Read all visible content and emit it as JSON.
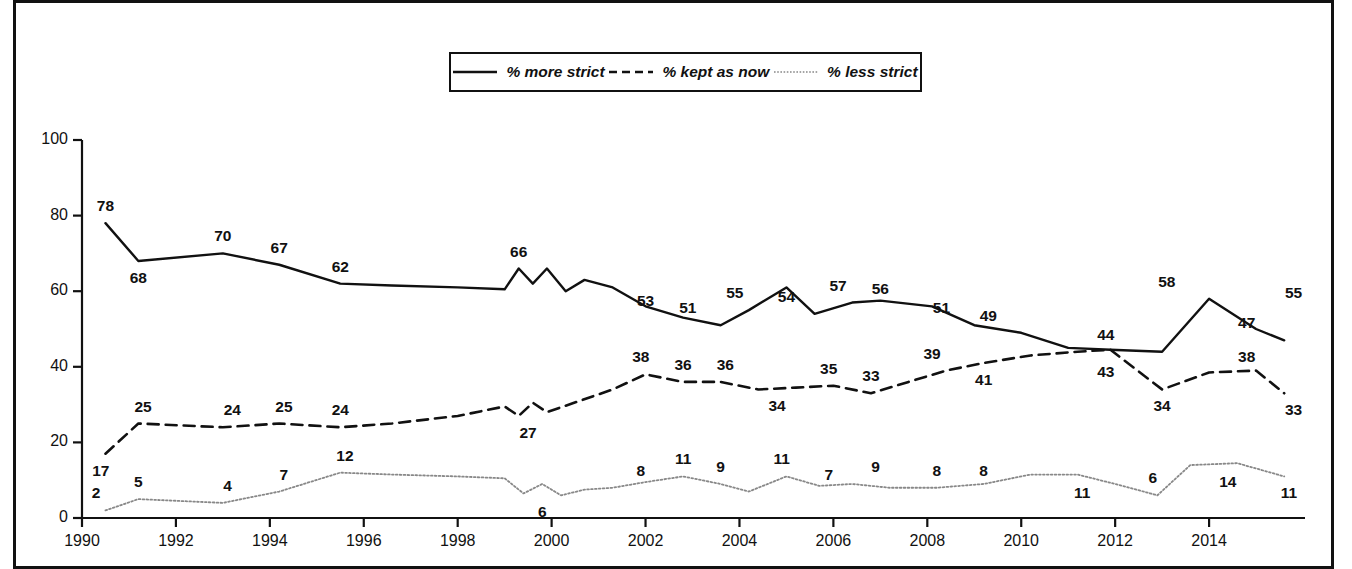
{
  "legend": {
    "items": [
      {
        "label": "% more strict",
        "style": "solid",
        "icon": "solid-line-icon"
      },
      {
        "label": "% kept as now",
        "style": "dashed",
        "icon": "dashed-line-icon"
      },
      {
        "label": "% less strict",
        "style": "dotted",
        "icon": "dotted-line-icon"
      }
    ]
  },
  "chart_data": {
    "type": "line",
    "title": "",
    "subtitle": "",
    "xlabel": "",
    "ylabel": "",
    "xlim": [
      1990,
      2016
    ],
    "ylim": [
      0,
      100
    ],
    "yticks": [
      0,
      20,
      40,
      60,
      80,
      100
    ],
    "xticks": [
      1990,
      1992,
      1994,
      1996,
      1998,
      2000,
      2002,
      2004,
      2006,
      2008,
      2010,
      2012,
      2014
    ],
    "grid": false,
    "legend_position": "top-center",
    "series": [
      {
        "name": "% more strict",
        "style": "solid",
        "color": "#111111",
        "x": [
          1990.5,
          1991.2,
          1993.0,
          1994.2,
          1995.5,
          1996.6,
          1998.0,
          1999.0,
          1999.3,
          1999.6,
          1999.9,
          2000.3,
          2000.7,
          2001.3,
          2002.0,
          2002.8,
          2003.6,
          2004.2,
          2005.0,
          2005.6,
          2006.4,
          2007.0,
          2008.1,
          2009.0,
          2010.0,
          2011.0,
          2011.9,
          2013.0,
          2014.0,
          2015.0,
          2015.6
        ],
        "y": [
          78,
          68,
          70,
          67,
          62,
          61.5,
          61,
          60.5,
          66,
          62,
          66,
          60,
          63,
          61,
          56,
          53,
          51,
          55,
          61,
          54,
          57,
          57.5,
          56,
          51,
          49,
          45,
          44.5,
          44,
          58,
          50,
          47
        ],
        "labels": [
          {
            "x": 1990.5,
            "y": 78,
            "text": "78"
          },
          {
            "x": 1991.2,
            "y": 68,
            "text": "68"
          },
          {
            "x": 1993.0,
            "y": 70,
            "text": "70"
          },
          {
            "x": 1994.2,
            "y": 67,
            "text": "67"
          },
          {
            "x": 1995.5,
            "y": 62,
            "text": "62"
          },
          {
            "x": 1999.3,
            "y": 66,
            "text": "66"
          },
          {
            "x": 2002.0,
            "y": 53,
            "text": "53"
          },
          {
            "x": 2002.9,
            "y": 51,
            "text": "51"
          },
          {
            "x": 2003.9,
            "y": 55,
            "text": "55"
          },
          {
            "x": 2005.0,
            "y": 54,
            "text": "54"
          },
          {
            "x": 2006.1,
            "y": 57,
            "text": "57"
          },
          {
            "x": 2007.0,
            "y": 56,
            "text": "56"
          },
          {
            "x": 2008.3,
            "y": 51,
            "text": "51"
          },
          {
            "x": 2009.3,
            "y": 49,
            "text": "49"
          },
          {
            "x": 2011.8,
            "y": 44,
            "text": "44"
          },
          {
            "x": 2013.1,
            "y": 58,
            "text": "58"
          },
          {
            "x": 2014.8,
            "y": 47,
            "text": "47"
          },
          {
            "x": 2015.8,
            "y": 55,
            "text": "55"
          }
        ]
      },
      {
        "name": "% kept as now",
        "style": "dashed",
        "color": "#111111",
        "x": [
          1990.5,
          1991.2,
          1993.0,
          1994.2,
          1995.5,
          1996.6,
          1998.0,
          1999.0,
          1999.3,
          1999.6,
          1999.9,
          2000.6,
          2001.3,
          2002.0,
          2002.8,
          2003.6,
          2004.4,
          2005.2,
          2006.0,
          2006.8,
          2007.6,
          2008.4,
          2009.2,
          2010.2,
          2011.2,
          2011.9,
          2013.0,
          2014.0,
          2015.0,
          2015.6
        ],
        "y": [
          17,
          25,
          24,
          25,
          24,
          25,
          27,
          29.5,
          27,
          30.5,
          28,
          31,
          34,
          38,
          36,
          36,
          34,
          34.5,
          35,
          33,
          36,
          39,
          41,
          43,
          44,
          44.5,
          34,
          38.5,
          39,
          33
        ],
        "labels": [
          {
            "x": 1990.4,
            "y": 17,
            "text": "17"
          },
          {
            "x": 1991.3,
            "y": 25,
            "text": "25"
          },
          {
            "x": 1993.2,
            "y": 24,
            "text": "24"
          },
          {
            "x": 1994.3,
            "y": 25,
            "text": "25"
          },
          {
            "x": 1995.5,
            "y": 24,
            "text": "24"
          },
          {
            "x": 1999.5,
            "y": 27,
            "text": "27"
          },
          {
            "x": 2001.9,
            "y": 38,
            "text": "38"
          },
          {
            "x": 2002.8,
            "y": 36,
            "text": "36"
          },
          {
            "x": 2003.7,
            "y": 36,
            "text": "36"
          },
          {
            "x": 2004.8,
            "y": 34,
            "text": "34"
          },
          {
            "x": 2005.9,
            "y": 35,
            "text": "35"
          },
          {
            "x": 2006.8,
            "y": 33,
            "text": "33"
          },
          {
            "x": 2008.1,
            "y": 39,
            "text": "39"
          },
          {
            "x": 2009.2,
            "y": 41,
            "text": "41"
          },
          {
            "x": 2011.8,
            "y": 43,
            "text": "43"
          },
          {
            "x": 2013.0,
            "y": 34,
            "text": "34"
          },
          {
            "x": 2014.8,
            "y": 38,
            "text": "38"
          },
          {
            "x": 2015.8,
            "y": 33,
            "text": "33"
          }
        ]
      },
      {
        "name": "% less strict",
        "style": "dotted",
        "color": "#888888",
        "x": [
          1990.5,
          1991.2,
          1993.0,
          1994.2,
          1995.5,
          1996.6,
          1998.0,
          1999.0,
          1999.4,
          1999.8,
          2000.2,
          2000.7,
          2001.3,
          2002.0,
          2002.8,
          2003.6,
          2004.2,
          2005.0,
          2005.7,
          2006.4,
          2007.2,
          2008.2,
          2009.2,
          2010.2,
          2011.2,
          2012.0,
          2012.9,
          2013.6,
          2014.6,
          2015.6
        ],
        "y": [
          2,
          5,
          4,
          7,
          12,
          11.5,
          11,
          10.5,
          6.5,
          9,
          6,
          7.5,
          8,
          9.5,
          11,
          9,
          7,
          11,
          8.5,
          9,
          8,
          8,
          9,
          11.5,
          11.5,
          9,
          6,
          14,
          14.5,
          11
        ],
        "labels": [
          {
            "x": 1990.3,
            "y": 2,
            "text": "2"
          },
          {
            "x": 1991.2,
            "y": 5,
            "text": "5"
          },
          {
            "x": 1993.1,
            "y": 4,
            "text": "4"
          },
          {
            "x": 1994.3,
            "y": 7,
            "text": "7"
          },
          {
            "x": 1995.6,
            "y": 12,
            "text": "12"
          },
          {
            "x": 1999.8,
            "y": 6,
            "text": "6"
          },
          {
            "x": 2001.9,
            "y": 8,
            "text": "8"
          },
          {
            "x": 2002.8,
            "y": 11,
            "text": "11"
          },
          {
            "x": 2003.6,
            "y": 9,
            "text": "9"
          },
          {
            "x": 2004.9,
            "y": 11,
            "text": "11"
          },
          {
            "x": 2005.9,
            "y": 7,
            "text": "7"
          },
          {
            "x": 2006.9,
            "y": 9,
            "text": "9"
          },
          {
            "x": 2008.2,
            "y": 8,
            "text": "8"
          },
          {
            "x": 2009.2,
            "y": 8,
            "text": "8"
          },
          {
            "x": 2011.3,
            "y": 11,
            "text": "11"
          },
          {
            "x": 2012.8,
            "y": 6,
            "text": "6"
          },
          {
            "x": 2014.4,
            "y": 14,
            "text": "14"
          },
          {
            "x": 2015.7,
            "y": 11,
            "text": "11"
          }
        ]
      }
    ]
  },
  "axis": {
    "y_tick_labels": [
      "0",
      "20",
      "40",
      "60",
      "80",
      "100"
    ],
    "x_tick_labels": [
      "1990",
      "1992",
      "1994",
      "1996",
      "1998",
      "2000",
      "2002",
      "2004",
      "2006",
      "2008",
      "2010",
      "2012",
      "2014"
    ]
  }
}
